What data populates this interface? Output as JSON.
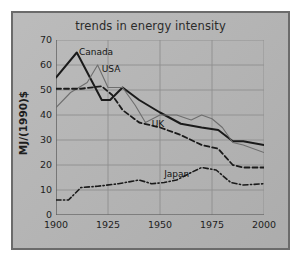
{
  "chart_data": {
    "type": "line",
    "title": "trends in energy intensity",
    "xlabel": "",
    "ylabel": "MJ/(1990)$",
    "xlim": [
      1900,
      2000
    ],
    "ylim": [
      0,
      70
    ],
    "xticks": [
      "1900",
      "1925",
      "1950",
      "1975",
      "2000"
    ],
    "yticks": [
      "0",
      "10",
      "20",
      "30",
      "40",
      "50",
      "60",
      "70"
    ],
    "grid": true,
    "legend_position": "inline-annotations",
    "annotations": [
      {
        "text": "Canada",
        "x": 1911,
        "y": 65
      },
      {
        "text": "USA",
        "x": 1922,
        "y": 58
      },
      {
        "text": "UK",
        "x": 1946,
        "y": 36
      },
      {
        "text": "Japan",
        "x": 1952,
        "y": 16
      }
    ],
    "series": [
      {
        "name": "Canada",
        "style": "solid-thick-black",
        "color": "#1a1a1a",
        "points": [
          [
            1900,
            55
          ],
          [
            1910,
            65
          ],
          [
            1922,
            46
          ],
          [
            1926,
            46
          ],
          [
            1932,
            51
          ],
          [
            1940,
            46
          ],
          [
            1950,
            41
          ],
          [
            1960,
            36.5
          ],
          [
            1970,
            35
          ],
          [
            1978,
            34
          ],
          [
            1985,
            29.5
          ],
          [
            1990,
            29.5
          ],
          [
            2000,
            28
          ]
        ]
      },
      {
        "name": "USA",
        "style": "solid-thin-gray",
        "color": "#6e6e6e",
        "points": [
          [
            1900,
            43
          ],
          [
            1907,
            49
          ],
          [
            1915,
            53
          ],
          [
            1920,
            60
          ],
          [
            1925,
            51
          ],
          [
            1932,
            51
          ],
          [
            1938,
            44
          ],
          [
            1943,
            37
          ],
          [
            1950,
            40
          ],
          [
            1958,
            40
          ],
          [
            1965,
            38
          ],
          [
            1970,
            40
          ],
          [
            1975,
            38.5
          ],
          [
            1980,
            35
          ],
          [
            1985,
            29
          ],
          [
            1990,
            28
          ],
          [
            2000,
            25
          ]
        ]
      },
      {
        "name": "UK",
        "style": "dashed-black",
        "color": "#1a1a1a",
        "points": [
          [
            1900,
            50.5
          ],
          [
            1912,
            50.5
          ],
          [
            1922,
            51.5
          ],
          [
            1927,
            48
          ],
          [
            1932,
            42
          ],
          [
            1940,
            37
          ],
          [
            1950,
            35
          ],
          [
            1960,
            32
          ],
          [
            1970,
            28
          ],
          [
            1978,
            26.5
          ],
          [
            1985,
            20
          ],
          [
            1990,
            19
          ],
          [
            2000,
            19
          ]
        ]
      },
      {
        "name": "Japan",
        "style": "dash-dot-black",
        "color": "#1a1a1a",
        "points": [
          [
            1900,
            6
          ],
          [
            1906,
            6
          ],
          [
            1912,
            11
          ],
          [
            1920,
            11.5
          ],
          [
            1930,
            12.5
          ],
          [
            1940,
            14
          ],
          [
            1946,
            12.5
          ],
          [
            1952,
            13
          ],
          [
            1958,
            14
          ],
          [
            1965,
            17
          ],
          [
            1970,
            19
          ],
          [
            1977,
            18
          ],
          [
            1984,
            13
          ],
          [
            1990,
            12
          ],
          [
            2000,
            12.5
          ]
        ]
      }
    ]
  }
}
